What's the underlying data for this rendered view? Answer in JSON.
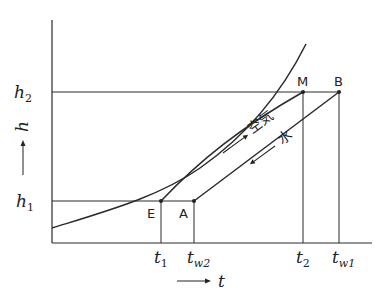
{
  "diagram": {
    "type": "enthalpy-temperature diagram (cooling tower / air-water contact)",
    "axes": {
      "x": {
        "label": "t",
        "arrow": "→",
        "ticks": [
          {
            "main": "t",
            "sub": "1"
          },
          {
            "main": "t",
            "sub": "w2"
          },
          {
            "main": "t",
            "sub": "2"
          },
          {
            "main": "t",
            "sub": "w1"
          }
        ]
      },
      "y": {
        "label": "h",
        "arrow": "→",
        "ticks": [
          {
            "main": "h",
            "sub": "1"
          },
          {
            "main": "h",
            "sub": "2"
          }
        ]
      }
    },
    "points": {
      "E": "E",
      "A": "A",
      "M": "M",
      "B": "B"
    },
    "line_labels": {
      "air": "空気",
      "water": "水"
    },
    "curves": [
      {
        "name": "saturation-curve",
        "description": "convex curve rising from lower-left to upper-right"
      },
      {
        "name": "air-operating-line",
        "from": "E",
        "to": "M",
        "direction": "up"
      },
      {
        "name": "water-operating-line",
        "from": "B",
        "to": "A",
        "direction": "down"
      }
    ]
  }
}
